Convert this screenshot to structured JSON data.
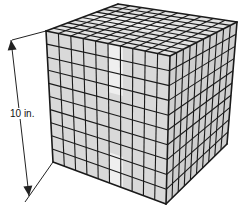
{
  "figure": {
    "type": "cube",
    "grid_divisions": 10,
    "dimension_label": "10 in.",
    "colors": {
      "face_left": "#d9d9d9",
      "face_right": "#cfcfcf",
      "face_top": "#e2e2e2",
      "grid_line": "#1a1a1a",
      "highlight": "#f4f4f4",
      "dimension_line": "#222222"
    },
    "vertices": {
      "top_back": [
        118,
        4
      ],
      "top_left": [
        46,
        31
      ],
      "top_front": [
        170,
        56
      ],
      "top_right": [
        237,
        22
      ],
      "bottom_left": [
        53,
        162
      ],
      "bottom_front": [
        166,
        204
      ],
      "bottom_right": [
        227,
        144
      ]
    },
    "dimension": {
      "start": [
        11,
        40
      ],
      "end": [
        29,
        196
      ],
      "ext_top_from": [
        12,
        40
      ],
      "ext_top_to": [
        46,
        31
      ],
      "ext_bottom_from": [
        25,
        202
      ],
      "ext_bottom_to": [
        53,
        162
      ],
      "label_pos": [
        9,
        108
      ]
    }
  }
}
